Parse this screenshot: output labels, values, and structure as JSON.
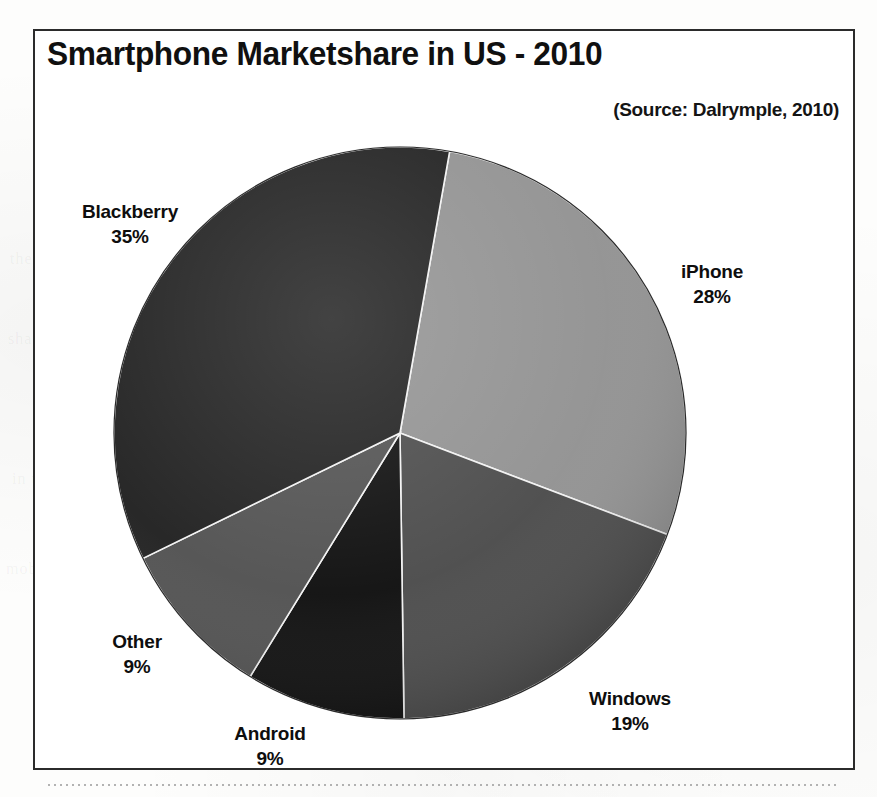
{
  "figure": {
    "title": "Smartphone Marketshare in US - 2010",
    "source": "(Source: Dalrymple, 2010)"
  },
  "chart_data": {
    "type": "pie",
    "title": "Smartphone Marketshare in US - 2010",
    "subtitle": "(Source: Dalrymple, 2010)",
    "unit": "percent",
    "start_angle_deg": 10,
    "direction": "clockwise",
    "legend": "none",
    "grid": false,
    "categories": [
      "iPhone",
      "Windows",
      "Android",
      "Other",
      "Blackberry"
    ],
    "values": [
      28,
      19,
      9,
      9,
      35
    ],
    "total": 100,
    "slices": [
      {
        "label": "iPhone",
        "value": 28,
        "value_text": "28%",
        "color": "#919191"
      },
      {
        "label": "Windows",
        "value": 19,
        "value_text": "19%",
        "color": "#4a4a4a"
      },
      {
        "label": "Android",
        "value": 9,
        "value_text": "9%",
        "color": "#0d0d0d"
      },
      {
        "label": "Other",
        "value": 9,
        "value_text": "9%",
        "color": "#505050"
      },
      {
        "label": "Blackberry",
        "value": 35,
        "value_text": "35%",
        "color": "#1f1f1f"
      }
    ]
  },
  "labels": {
    "blackberry": {
      "name": "Blackberry",
      "value": "35%"
    },
    "iphone": {
      "name": "iPhone",
      "value": "28%"
    },
    "windows": {
      "name": "Windows",
      "value": "19%"
    },
    "other": {
      "name": "Other",
      "value": "9%"
    },
    "android": {
      "name": "Android",
      "value": "9%"
    }
  },
  "page": {
    "ghost_lines": [
      "the market",
      "share of",
      "devices",
      "in the",
      "report",
      "mobile"
    ]
  }
}
